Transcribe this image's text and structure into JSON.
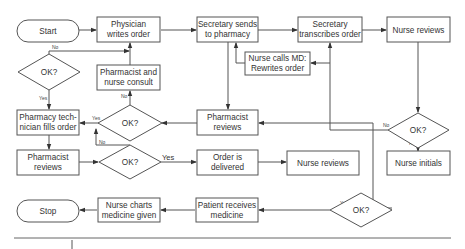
{
  "diagram": {
    "title": "",
    "nodes": {
      "start": {
        "label": "Start"
      },
      "physician_writes": {
        "line1": "Physician",
        "line2": "writes order"
      },
      "secretary_sends": {
        "line1": "Secretary sends",
        "line2": "to pharmacy"
      },
      "secretary_transcribes": {
        "line1": "Secretary",
        "line2": "transcribes order"
      },
      "nurse_reviews_top": {
        "label": "Nurse reviews"
      },
      "nurse_calls_md": {
        "line1": "Nurse calls MD:",
        "line2": "Rewrites order"
      },
      "ok_left": {
        "label": "OK?"
      },
      "pharmacist_nurse_consult": {
        "line1": "Pharmacist and",
        "line2": "nurse consult"
      },
      "ok_pharmacist": {
        "label": "OK?"
      },
      "pharmacist_reviews_mid": {
        "line1": "Pharmacist",
        "line2": "reviews"
      },
      "ok_nurse": {
        "label": "OK?"
      },
      "pharmacy_tech_fills": {
        "line1": "Pharmacy tech-",
        "line2": "nician fills order"
      },
      "pharmacist_reviews_left": {
        "line1": "Pharmacist",
        "line2": "reviews"
      },
      "ok_final_check": {
        "label": "OK?"
      },
      "order_delivered": {
        "line1": "Order is",
        "line2": "delivered"
      },
      "nurse_reviews_mid": {
        "label": "Nurse reviews"
      },
      "nurse_initials": {
        "label": "Nurse initials"
      },
      "ok_bottom": {
        "label": "OK?"
      },
      "patient_receives": {
        "line1": "Patient receives",
        "line2": "medicine"
      },
      "nurse_charts": {
        "line1": "Nurse charts",
        "line2": "medicine given"
      },
      "stop": {
        "label": "Stop"
      }
    },
    "edge_labels": {
      "yes": "Yes",
      "no": "No"
    }
  }
}
